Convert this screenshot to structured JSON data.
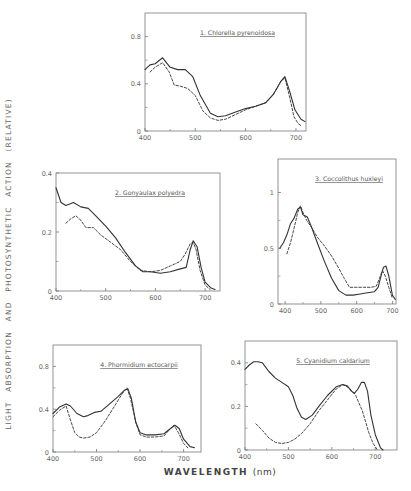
{
  "figure": {
    "ylabel": "LIGHT ABSORPTION AND PHOTOSYNTHETIC ACTION (RELATIVE)",
    "xlabel": "WAVELENGTH",
    "xlabel_unit": "(nm)"
  },
  "chart_data": [
    {
      "type": "line",
      "title": "1. Chlorella pyrenoidosa",
      "xlabel": "Wavelength (nm)",
      "ylabel": "Relative",
      "xlim": [
        400,
        720
      ],
      "ylim": [
        0,
        1.0
      ],
      "xticks": [
        400,
        500,
        600,
        700
      ],
      "yticks": [
        0,
        0.4,
        0.8
      ],
      "frame": {
        "left": 145,
        "top": 13,
        "right": 306,
        "bottom": 131
      },
      "series": [
        {
          "name": "absorption",
          "style": "solid",
          "x": [
            400,
            410,
            420,
            435,
            450,
            465,
            480,
            495,
            510,
            530,
            545,
            560,
            580,
            600,
            620,
            640,
            655,
            670,
            678,
            688,
            698,
            710,
            718
          ],
          "y": [
            0.52,
            0.56,
            0.57,
            0.62,
            0.54,
            0.52,
            0.52,
            0.46,
            0.3,
            0.15,
            0.12,
            0.13,
            0.16,
            0.19,
            0.21,
            0.24,
            0.31,
            0.42,
            0.46,
            0.33,
            0.18,
            0.1,
            0.08
          ]
        },
        {
          "name": "photosynthetic action",
          "style": "dashed",
          "x": [
            410,
            420,
            435,
            448,
            458,
            470,
            485,
            500,
            515,
            530,
            545,
            560,
            580,
            600,
            620,
            640,
            655,
            670,
            678,
            688,
            696,
            705,
            712
          ],
          "y": [
            0.5,
            0.54,
            0.58,
            0.5,
            0.39,
            0.38,
            0.36,
            0.3,
            0.17,
            0.11,
            0.09,
            0.1,
            0.14,
            0.18,
            0.21,
            0.24,
            0.31,
            0.42,
            0.45,
            0.28,
            0.12,
            0.06,
            0.04
          ]
        }
      ]
    },
    {
      "type": "line",
      "title": "2. Gonyaulax polyedra",
      "xlabel": "Wavelength (nm)",
      "ylabel": "Relative",
      "xlim": [
        400,
        730
      ],
      "ylim": [
        0,
        0.4
      ],
      "xticks": [
        400,
        500,
        600,
        700
      ],
      "yticks": [
        0,
        0.2,
        0.4
      ],
      "frame": {
        "left": 56,
        "top": 173,
        "right": 220,
        "bottom": 291
      },
      "series": [
        {
          "name": "absorption",
          "style": "solid",
          "x": [
            400,
            410,
            420,
            435,
            450,
            465,
            480,
            500,
            520,
            540,
            560,
            575,
            590,
            610,
            630,
            650,
            662,
            670,
            676,
            684,
            692,
            700,
            712,
            720
          ],
          "y": [
            0.35,
            0.3,
            0.29,
            0.3,
            0.285,
            0.28,
            0.255,
            0.22,
            0.18,
            0.13,
            0.085,
            0.065,
            0.065,
            0.06,
            0.065,
            0.075,
            0.08,
            0.14,
            0.17,
            0.15,
            0.08,
            0.03,
            0.01,
            0.005
          ]
        },
        {
          "name": "photosynthetic action",
          "style": "dashed",
          "x": [
            420,
            430,
            440,
            450,
            460,
            475,
            490,
            510,
            530,
            550,
            570,
            590,
            610,
            630,
            650,
            660,
            670,
            676,
            682,
            690,
            700,
            710
          ],
          "y": [
            0.23,
            0.245,
            0.255,
            0.24,
            0.215,
            0.215,
            0.19,
            0.165,
            0.14,
            0.1,
            0.07,
            0.065,
            0.07,
            0.085,
            0.1,
            0.125,
            0.16,
            0.165,
            0.14,
            0.07,
            0.02,
            0.005
          ]
        }
      ]
    },
    {
      "type": "line",
      "title": "3. Coccolithus huxleyi",
      "xlabel": "Wavelength (nm)",
      "ylabel": "Relative",
      "xlim": [
        380,
        710
      ],
      "ylim": [
        0,
        1.3
      ],
      "xticks": [
        400,
        500,
        600,
        700
      ],
      "yticks": [
        0,
        0.5,
        1.0
      ],
      "frame": {
        "left": 278,
        "top": 159,
        "right": 396,
        "bottom": 304
      },
      "series": [
        {
          "name": "absorption",
          "style": "solid",
          "x": [
            385,
            395,
            405,
            415,
            425,
            435,
            443,
            450,
            462,
            475,
            490,
            510,
            530,
            550,
            570,
            590,
            610,
            630,
            650,
            660,
            668,
            675,
            682,
            690,
            700,
            708
          ],
          "y": [
            0.5,
            0.55,
            0.62,
            0.72,
            0.77,
            0.85,
            0.87,
            0.8,
            0.78,
            0.68,
            0.55,
            0.38,
            0.23,
            0.12,
            0.08,
            0.08,
            0.09,
            0.1,
            0.11,
            0.15,
            0.25,
            0.33,
            0.34,
            0.25,
            0.08,
            0.04
          ]
        },
        {
          "name": "photosynthetic action",
          "style": "dashed",
          "x": [
            405,
            415,
            425,
            435,
            443,
            450,
            460,
            475,
            490,
            510,
            530,
            550,
            565,
            580,
            600,
            620,
            640,
            655,
            665,
            672,
            680,
            690,
            700
          ],
          "y": [
            0.45,
            0.55,
            0.68,
            0.82,
            0.88,
            0.82,
            0.75,
            0.68,
            0.6,
            0.52,
            0.43,
            0.32,
            0.23,
            0.15,
            0.15,
            0.15,
            0.15,
            0.16,
            0.24,
            0.3,
            0.25,
            0.15,
            0.05
          ]
        }
      ]
    },
    {
      "type": "line",
      "title": "4. Phormidium ectocarpii",
      "xlabel": "Wavelength (nm)",
      "ylabel": "Relative",
      "xlim": [
        400,
        740
      ],
      "ylim": [
        0,
        1.0
      ],
      "xticks": [
        400,
        500,
        600,
        700
      ],
      "yticks": [
        0,
        0.4,
        0.8
      ],
      "frame": {
        "left": 53,
        "top": 345,
        "right": 201,
        "bottom": 452
      },
      "series": [
        {
          "name": "absorption",
          "style": "solid",
          "x": [
            400,
            415,
            430,
            440,
            455,
            470,
            480,
            495,
            510,
            530,
            550,
            565,
            572,
            580,
            590,
            600,
            615,
            635,
            655,
            670,
            680,
            690,
            700,
            715,
            725
          ],
          "y": [
            0.36,
            0.42,
            0.45,
            0.43,
            0.36,
            0.33,
            0.34,
            0.37,
            0.38,
            0.45,
            0.52,
            0.58,
            0.59,
            0.5,
            0.28,
            0.18,
            0.16,
            0.16,
            0.17,
            0.22,
            0.25,
            0.22,
            0.12,
            0.05,
            0.04
          ]
        },
        {
          "name": "photosynthetic action",
          "style": "dashed",
          "x": [
            400,
            415,
            430,
            440,
            450,
            460,
            470,
            485,
            500,
            520,
            540,
            560,
            570,
            578,
            590,
            600,
            615,
            635,
            655,
            670,
            678,
            688,
            700,
            712
          ],
          "y": [
            0.33,
            0.39,
            0.43,
            0.3,
            0.18,
            0.14,
            0.13,
            0.14,
            0.18,
            0.29,
            0.42,
            0.55,
            0.6,
            0.5,
            0.28,
            0.16,
            0.14,
            0.14,
            0.15,
            0.22,
            0.25,
            0.18,
            0.08,
            0.03
          ]
        }
      ]
    },
    {
      "type": "line",
      "title": "5. Cyanidium caldarium",
      "xlabel": "Wavelength (nm)",
      "ylabel": "Relative",
      "xlim": [
        400,
        750
      ],
      "ylim": [
        0,
        0.5
      ],
      "xticks": [
        400,
        500,
        600,
        700
      ],
      "yticks": [
        0,
        0.2,
        0.4
      ],
      "frame": {
        "left": 245,
        "top": 341,
        "right": 397,
        "bottom": 450
      },
      "series": [
        {
          "name": "absorption",
          "style": "solid",
          "x": [
            400,
            410,
            420,
            430,
            440,
            455,
            470,
            485,
            500,
            510,
            520,
            530,
            540,
            555,
            570,
            590,
            610,
            625,
            635,
            645,
            652,
            660,
            668,
            675,
            682,
            690,
            700,
            712,
            718
          ],
          "y": [
            0.37,
            0.39,
            0.405,
            0.405,
            0.4,
            0.36,
            0.33,
            0.31,
            0.29,
            0.25,
            0.19,
            0.15,
            0.14,
            0.16,
            0.2,
            0.25,
            0.29,
            0.3,
            0.295,
            0.27,
            0.26,
            0.28,
            0.31,
            0.31,
            0.27,
            0.16,
            0.07,
            0.01,
            0
          ]
        },
        {
          "name": "photosynthetic action",
          "style": "dashed",
          "x": [
            425,
            440,
            455,
            470,
            485,
            500,
            515,
            530,
            550,
            570,
            590,
            610,
            625,
            640,
            655,
            670,
            685,
            695,
            705
          ],
          "y": [
            0.12,
            0.09,
            0.055,
            0.035,
            0.03,
            0.035,
            0.05,
            0.075,
            0.12,
            0.18,
            0.23,
            0.28,
            0.3,
            0.285,
            0.25,
            0.18,
            0.08,
            0.03,
            0
          ]
        }
      ]
    }
  ]
}
